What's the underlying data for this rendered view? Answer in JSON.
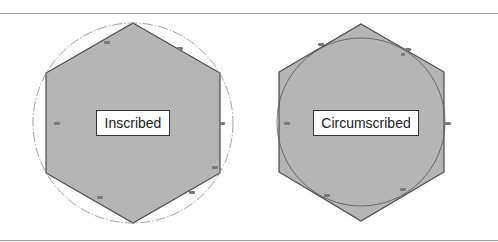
{
  "colors": {
    "fill": "#b5b5b5",
    "stroke": "#4a4a4a",
    "circle_outer": "#8a8a8a",
    "circle_inner": "#555555",
    "rule": "#9a9a9a"
  },
  "figures": [
    {
      "id": "inscribed",
      "label": "Inscribed",
      "description": "Regular hexagon inscribed in a dash-dot circle",
      "hexagon_points": "133,23 220,73 220,173 133,223 46,173 46,73",
      "circle": {
        "cx": 133,
        "cy": 123,
        "r": 100,
        "style": "dash-dot"
      },
      "markers": 8
    },
    {
      "id": "circumscribed",
      "label": "Circumscribed",
      "description": "Regular hexagon circumscribed about a solid circle",
      "hexagon_points": "361,24 444,72 444,172 361,221 279,172 279,72",
      "circle": {
        "cx": 361,
        "cy": 122,
        "r": 84,
        "style": "solid"
      },
      "markers": 7
    }
  ]
}
